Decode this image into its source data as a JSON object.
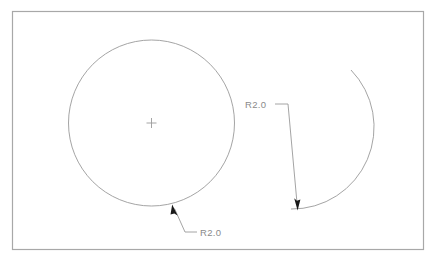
{
  "drawing": {
    "title": "radius-dimension-drawing",
    "background_color": "#ffffff",
    "line_color": "#9a9a9a",
    "frame_color": "#a8a8a8",
    "text_color": "#8a8a8a",
    "arrow_color": "#1a1a1a"
  },
  "frame": {
    "x": 12,
    "y": 11,
    "width": 412,
    "height": 239
  },
  "shapes": {
    "circle": {
      "name": "full-circle",
      "cx": 151.5,
      "cy": 123,
      "r": 83
    },
    "center_mark": {
      "name": "center-cross",
      "cx": 151.5,
      "cy": 123,
      "size": 5
    },
    "arc": {
      "name": "open-arc",
      "cx": 288,
      "cy": 140,
      "r": 82,
      "start_x": 351,
      "start_y": 70,
      "end_x": 291,
      "end_y": 209
    }
  },
  "annotations": [
    {
      "name": "radius-label-circle",
      "text": "R2.0",
      "text_x": 190,
      "text_y": 236,
      "leader": {
        "arrow_x": 173,
        "arrow_y": 206,
        "elbow_x": 185,
        "elbow_y": 232,
        "tail_x": 197,
        "tail_y": 232
      }
    },
    {
      "name": "radius-label-arc",
      "text": "R2.0",
      "text_x": 245,
      "text_y": 109,
      "leader": {
        "arrow_x": 297,
        "arrow_y": 207,
        "elbow_x": 288,
        "elbow_y": 104,
        "tail_x": 275,
        "tail_y": 104
      }
    }
  ]
}
